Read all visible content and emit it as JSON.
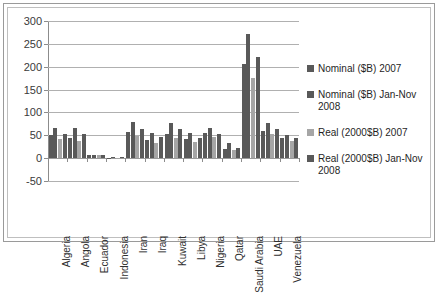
{
  "chart_data": {
    "type": "bar",
    "title": "",
    "xlabel": "",
    "ylabel": "",
    "ylim": [
      -50,
      300
    ],
    "yticks": [
      -50,
      0,
      50,
      100,
      150,
      200,
      250,
      300
    ],
    "ytick_labels": [
      "-50",
      "0",
      "50",
      "100",
      "150",
      "200",
      "250",
      "300"
    ],
    "grid": true,
    "legend_position": "right",
    "categories": [
      "Algeria",
      "Angola",
      "Ecuador",
      "Indonesia",
      "Iran",
      "Iraq",
      "Kuwait",
      "Libya",
      "Nigeria",
      "Qatar",
      "Saudi Arabia",
      "UAE",
      "Venezuela"
    ],
    "series": [
      {
        "name": "Nominal ($B) 2007",
        "color": "#595959",
        "values": [
          50,
          44,
          7,
          -1,
          57,
          39,
          53,
          43,
          55,
          21,
          206,
          60,
          45
        ]
      },
      {
        "name": "Nominal ($B) Jan-Nov 2008",
        "color": "#595959",
        "values": [
          67,
          65,
          8,
          3,
          79,
          54,
          77,
          55,
          66,
          33,
          272,
          78,
          50
        ]
      },
      {
        "name": "Real (2000$B) 2007",
        "color": "#a6a6a6",
        "values": [
          41,
          37,
          6,
          -1,
          48,
          33,
          45,
          36,
          46,
          18,
          175,
          52,
          38
        ]
      },
      {
        "name": "Real (2000$B) Jan-Nov 2008",
        "color": "#595959",
        "values": [
          53,
          53,
          6,
          3,
          64,
          47,
          64,
          44,
          53,
          23,
          222,
          63,
          45
        ]
      }
    ]
  },
  "legend": {
    "items": [
      {
        "label": "Nominal ($B) 2007",
        "color": "#595959"
      },
      {
        "label": "Nominal ($B) Jan-Nov 2008",
        "color": "#595959"
      },
      {
        "label": "Real (2000$B) 2007",
        "color": "#a6a6a6"
      },
      {
        "label": "Real (2000$B) Jan-Nov 2008",
        "color": "#595959"
      }
    ]
  }
}
